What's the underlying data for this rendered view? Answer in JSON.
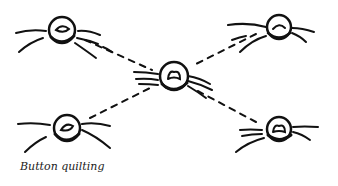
{
  "caption": "Button quilting",
  "colors": {
    "ink": "#111111",
    "background": "#ffffff"
  },
  "illustration": {
    "buttons": [
      {
        "id": "top-left",
        "cx": 62,
        "cy": 30
      },
      {
        "id": "top-right",
        "cx": 279,
        "cy": 27
      },
      {
        "id": "center",
        "cx": 174,
        "cy": 76
      },
      {
        "id": "bottom-left",
        "cx": 67,
        "cy": 128
      },
      {
        "id": "bottom-right",
        "cx": 279,
        "cy": 129
      }
    ],
    "connections": [
      [
        "top-left",
        "center"
      ],
      [
        "top-right",
        "center"
      ],
      [
        "bottom-left",
        "center"
      ],
      [
        "bottom-right",
        "center"
      ]
    ]
  }
}
